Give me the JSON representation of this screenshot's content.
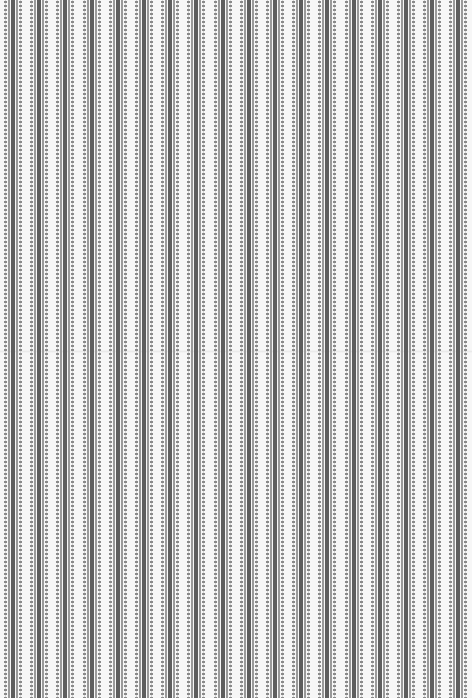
{
  "pattern": {
    "description": "vertical striped texture",
    "stripe_count": 18,
    "period_px": 26.2,
    "first_offset_px": 4,
    "colors": {
      "background": "#f7f7f7",
      "core": "#5e5e5e",
      "side_line": "#9a9a9a",
      "dots": "#8a8a8a"
    }
  }
}
